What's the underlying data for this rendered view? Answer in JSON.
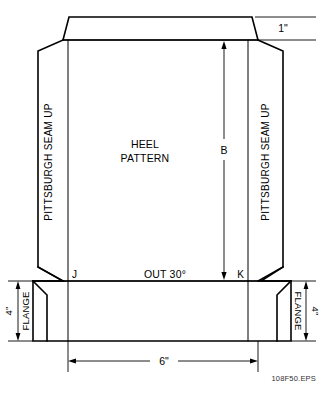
{
  "drawing": {
    "title_lines": {
      "line1": "HEEL",
      "line2": "PATTERN"
    },
    "angle_note": "OUT 30°",
    "points": {
      "left": "J",
      "right": "K"
    },
    "side_note_left": "PITTSBURGH SEAM  UP",
    "side_note_right": "PITTSBURGH SEAM  UP",
    "dimensions": {
      "top_flap": "1\"",
      "height_symbol": "B",
      "flange_left": "4\"",
      "flange_right": "4\"",
      "width_bottom": "6\""
    },
    "flange_label_left": "FLANGE",
    "flange_label_right": "FLANGE",
    "caption": "108F50.EPS",
    "colors": {
      "line": "#000000",
      "background": "#ffffff",
      "caption": "#333333"
    }
  }
}
